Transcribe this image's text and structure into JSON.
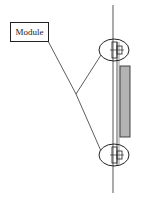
{
  "diagram": {
    "label": "Module",
    "colors": {
      "stroke": "#222222",
      "panel_fill": "#b3b3b3",
      "background": "#ffffff"
    },
    "elements": {
      "callout_label": "Module",
      "top_ellipse": {
        "cx": 114,
        "cy": 50,
        "rx": 15,
        "ry": 11
      },
      "bottom_ellipse": {
        "cx": 114,
        "cy": 155,
        "rx": 15,
        "ry": 11
      },
      "grey_panel": {
        "x": 121,
        "y": 66,
        "width": 10,
        "height": 71
      }
    }
  }
}
